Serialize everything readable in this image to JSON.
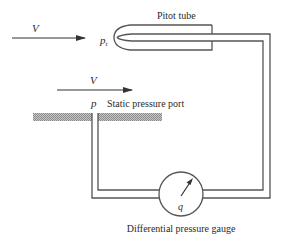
{
  "diagram": {
    "labels": {
      "pitot_tube": "Pitot tube",
      "total_pressure": "p",
      "total_pressure_sub": "t",
      "freestream_velocity_top": "V",
      "freestream_velocity_wall": "V",
      "static_pressure": "p",
      "static_port": "Static pressure port",
      "gauge_symbol": "q",
      "gauge": "Differential pressure gauge"
    },
    "colors": {
      "line": "#555555",
      "text": "#2a2a2a",
      "hatch": "#9a9a9a",
      "background": "#ffffff"
    }
  }
}
